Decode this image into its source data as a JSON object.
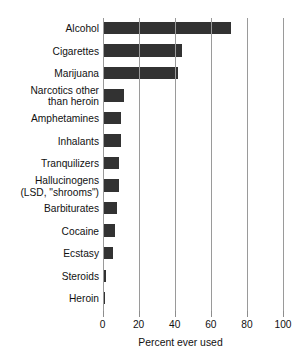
{
  "chart_data": {
    "type": "bar",
    "orientation": "horizontal",
    "title": "",
    "xlabel": "Percent ever used",
    "ylabel": "",
    "xlim": [
      0,
      100
    ],
    "xticks": [
      0,
      20,
      40,
      60,
      80,
      100
    ],
    "xtick_labels": [
      "0",
      "20",
      "40",
      "60",
      "80",
      "100"
    ],
    "grid": "vertical",
    "legend": "none",
    "bar_color": "#323232",
    "gridline_color": "#9a9a9a",
    "categories": [
      "Alcohol",
      "Cigarettes",
      "Marijuana",
      "Narcotics other\nthan heroin",
      "Amphetamines",
      "Inhalants",
      "Tranquilizers",
      "Hallucinogens\n(LSD, \"shrooms\")",
      "Barbiturates",
      "Cocaine",
      "Ecstasy",
      "Steroids",
      "Heroin"
    ],
    "values": [
      71,
      44,
      42,
      12,
      10,
      10,
      9,
      9,
      8,
      7,
      6,
      2,
      1.5
    ]
  }
}
